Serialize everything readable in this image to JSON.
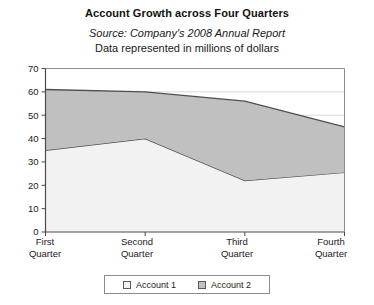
{
  "figure": {
    "title": "Account Growth across Four Quarters",
    "subtitle": "Source: Company's 2008 Annual Report",
    "subtitle2": "Data represented in millions of dollars"
  },
  "legend": {
    "items": [
      {
        "label": "Account 1",
        "swatch": "#f2f2f2",
        "swatch_name": "legend-swatch-account-1"
      },
      {
        "label": "Account 2",
        "swatch": "#c0c0c0",
        "swatch_name": "legend-swatch-account-2"
      }
    ]
  },
  "axis": {
    "y_ticks": [
      "70",
      "60",
      "50",
      "40",
      "30",
      "20",
      "10",
      "0"
    ],
    "x_labels": [
      {
        "line1": "First",
        "line2": "Quarter"
      },
      {
        "line1": "Second",
        "line2": "Quarter"
      },
      {
        "line1": "Third",
        "line2": "Quarter"
      },
      {
        "line1": "Fourth",
        "line2": "Quarter"
      }
    ]
  },
  "chart_data": {
    "type": "area",
    "stacked": true,
    "title": "Account Growth across Four Quarters",
    "subtitle": "Source: Company's 2008 Annual Report",
    "annotation": "Data represented in millions of dollars",
    "xlabel": "",
    "ylabel": "",
    "units": "millions of dollars",
    "categories": [
      "First Quarter",
      "Second Quarter",
      "Third Quarter",
      "Fourth Quarter"
    ],
    "series": [
      {
        "name": "Account 1",
        "values": [
          35,
          40,
          22,
          25.5
        ],
        "color": "#f2f2f2"
      },
      {
        "name": "Account 2",
        "values": [
          26,
          20,
          34,
          19.5
        ],
        "color": "#c0c0c0"
      }
    ],
    "cumulative_totals": [
      61,
      60,
      56,
      45
    ],
    "ylim": [
      0,
      70
    ],
    "ytick_step": 10,
    "yticks": [
      0,
      10,
      20,
      30,
      40,
      50,
      60,
      70
    ],
    "grid": "horizontal-partial",
    "legend_position": "bottom"
  }
}
